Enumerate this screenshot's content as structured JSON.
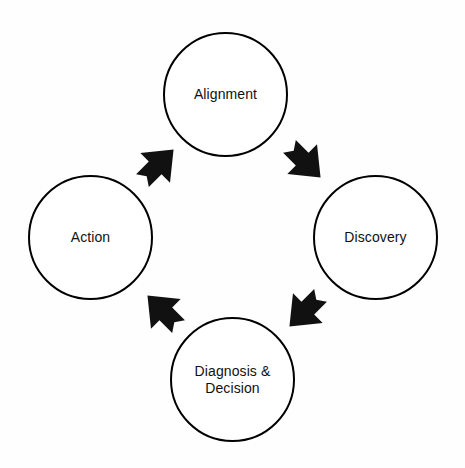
{
  "diagram": {
    "type": "cycle",
    "background_color": "#fefefe",
    "stroke_color": "#000000",
    "arrow_color": "#111111",
    "nodes": [
      {
        "id": "alignment",
        "label": "Alignment",
        "position": "top",
        "cx": 225.5,
        "cy": 94.5,
        "r": 62.5
      },
      {
        "id": "discovery",
        "label": "Discovery",
        "position": "right",
        "cx": 375.5,
        "cy": 237.5,
        "r": 62.5
      },
      {
        "id": "diagnosis",
        "label": "Diagnosis &\nDecision",
        "position": "bottom",
        "cx": 232.5,
        "cy": 379.5,
        "r": 62.5
      },
      {
        "id": "action",
        "label": "Action",
        "position": "left",
        "cx": 90.5,
        "cy": 237.5,
        "r": 62.5
      }
    ],
    "arrows": [
      {
        "id": "alignment-to-discovery",
        "from": "alignment",
        "to": "discovery",
        "direction": "down-right",
        "cx": 305,
        "cy": 162,
        "rotation": 135
      },
      {
        "id": "discovery-to-diagnosis",
        "from": "discovery",
        "to": "diagnosis",
        "direction": "down-left",
        "cx": 305,
        "cy": 311,
        "rotation": 225
      },
      {
        "id": "diagnosis-to-action",
        "from": "diagnosis",
        "to": "action",
        "direction": "up-left",
        "cx": 163,
        "cy": 311,
        "rotation": 315
      },
      {
        "id": "action-to-alignment",
        "from": "action",
        "to": "alignment",
        "direction": "up-right",
        "cx": 158,
        "cy": 165,
        "rotation": 45
      }
    ]
  }
}
